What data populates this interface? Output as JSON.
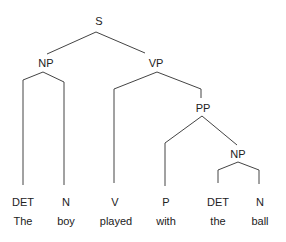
{
  "tree": {
    "root": "S",
    "nodes": {
      "s": "S",
      "np_subject": "NP",
      "vp": "VP",
      "pp": "PP",
      "np_object": "NP"
    },
    "leaves": [
      {
        "tag": "DET",
        "word": "The"
      },
      {
        "tag": "N",
        "word": "boy"
      },
      {
        "tag": "V",
        "word": "played"
      },
      {
        "tag": "P",
        "word": "with"
      },
      {
        "tag": "DET",
        "word": "the"
      },
      {
        "tag": "N",
        "word": "ball"
      }
    ]
  },
  "colors": {
    "line": "#444444",
    "text": "#222222",
    "background": "#ffffff"
  }
}
